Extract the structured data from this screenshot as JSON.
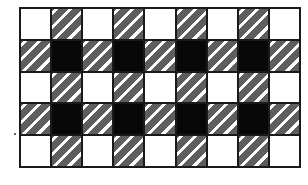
{
  "pattern": {
    "rows": 5,
    "cols": 9,
    "colors": {
      "white": "#ffffff",
      "black": "#080808",
      "hatch_dark": "#5e5e5e",
      "line": "#1a1a1a"
    },
    "cells": [
      [
        "white",
        "hatch",
        "white",
        "hatch",
        "white",
        "hatch",
        "white",
        "hatch",
        "white"
      ],
      [
        "hatch",
        "black",
        "hatch",
        "black",
        "hatch",
        "black",
        "hatch",
        "black",
        "hatch"
      ],
      [
        "white",
        "hatch",
        "white",
        "hatch",
        "white",
        "hatch",
        "white",
        "hatch",
        "white"
      ],
      [
        "hatch",
        "black",
        "hatch",
        "black",
        "hatch",
        "black",
        "hatch",
        "black",
        "hatch"
      ],
      [
        "white",
        "hatch",
        "white",
        "hatch",
        "white",
        "hatch",
        "white",
        "hatch",
        "white"
      ]
    ]
  }
}
